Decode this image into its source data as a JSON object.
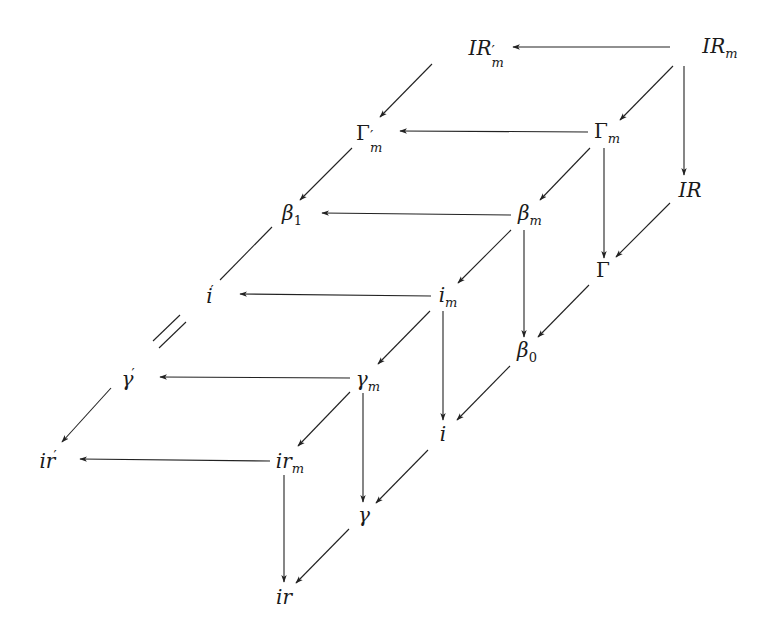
{
  "diagram": {
    "type": "commutative-diagram",
    "stroke_color": "#222222",
    "nodes": [
      {
        "id": "IRpm",
        "base": "IR",
        "prime": "′",
        "sub": "m",
        "x": 487,
        "y": 48
      },
      {
        "id": "IRm",
        "base": "IR",
        "prime": "",
        "sub": "m",
        "x": 720,
        "y": 48
      },
      {
        "id": "Gpm",
        "base": "Γ",
        "prime": "′",
        "sub": "m",
        "x": 370,
        "y": 133,
        "upright": true
      },
      {
        "id": "Gm",
        "base": "Γ",
        "prime": "",
        "sub": "m",
        "x": 607,
        "y": 133,
        "upright": true
      },
      {
        "id": "IR",
        "base": "IR",
        "prime": "",
        "sub": "",
        "x": 690,
        "y": 190
      },
      {
        "id": "b1",
        "base": "β",
        "prime": "",
        "sub": "1",
        "x": 292,
        "y": 215
      },
      {
        "id": "bm",
        "base": "β",
        "prime": "",
        "sub": "m",
        "x": 530,
        "y": 215
      },
      {
        "id": "G",
        "base": "Γ",
        "prime": "",
        "sub": "",
        "x": 603,
        "y": 270,
        "upright": true
      },
      {
        "id": "ip",
        "base": "i",
        "prime": "′",
        "sub": "",
        "x": 210,
        "y": 295
      },
      {
        "id": "im",
        "base": "i",
        "prime": "",
        "sub": "m",
        "x": 448,
        "y": 297
      },
      {
        "id": "b0",
        "base": "β",
        "prime": "",
        "sub": "0",
        "x": 527,
        "y": 352
      },
      {
        "id": "gp",
        "base": "γ",
        "prime": "′",
        "sub": "",
        "x": 128,
        "y": 378
      },
      {
        "id": "gm",
        "base": "γ",
        "prime": "",
        "sub": "m",
        "x": 368,
        "y": 381
      },
      {
        "id": "i",
        "base": "i",
        "prime": "",
        "sub": "",
        "x": 443,
        "y": 434
      },
      {
        "id": "irp",
        "base": "ir",
        "prime": "′",
        "sub": "",
        "x": 48,
        "y": 460
      },
      {
        "id": "irm",
        "base": "ir",
        "prime": "",
        "sub": "m",
        "x": 290,
        "y": 463
      },
      {
        "id": "g",
        "base": "γ",
        "prime": "",
        "sub": "",
        "x": 364,
        "y": 515
      },
      {
        "id": "ir",
        "base": "ir",
        "prime": "",
        "sub": "",
        "x": 284,
        "y": 597
      }
    ],
    "arrows": [
      {
        "x1": 670,
        "y1": 47,
        "x2": 513,
        "y2": 47
      },
      {
        "x1": 673,
        "y1": 66,
        "x2": 620,
        "y2": 120
      },
      {
        "x1": 684,
        "y1": 66,
        "x2": 684,
        "y2": 175
      },
      {
        "x1": 432,
        "y1": 64,
        "x2": 380,
        "y2": 117
      },
      {
        "x1": 588,
        "y1": 132,
        "x2": 400,
        "y2": 131
      },
      {
        "x1": 590,
        "y1": 148,
        "x2": 540,
        "y2": 200
      },
      {
        "x1": 604,
        "y1": 148,
        "x2": 604,
        "y2": 258
      },
      {
        "x1": 670,
        "y1": 203,
        "x2": 616,
        "y2": 257
      },
      {
        "x1": 352,
        "y1": 148,
        "x2": 300,
        "y2": 200
      },
      {
        "x1": 511,
        "y1": 215,
        "x2": 322,
        "y2": 213
      },
      {
        "x1": 511,
        "y1": 230,
        "x2": 458,
        "y2": 283
      },
      {
        "x1": 524,
        "y1": 230,
        "x2": 524,
        "y2": 337
      },
      {
        "x1": 589,
        "y1": 285,
        "x2": 538,
        "y2": 337
      },
      {
        "x1": 431,
        "y1": 296,
        "x2": 240,
        "y2": 294
      },
      {
        "x1": 430,
        "y1": 311,
        "x2": 378,
        "y2": 364
      },
      {
        "x1": 443,
        "y1": 311,
        "x2": 443,
        "y2": 420
      },
      {
        "x1": 510,
        "y1": 366,
        "x2": 457,
        "y2": 420
      },
      {
        "x1": 350,
        "y1": 378,
        "x2": 160,
        "y2": 377
      },
      {
        "x1": 350,
        "y1": 392,
        "x2": 298,
        "y2": 446
      },
      {
        "x1": 363,
        "y1": 393,
        "x2": 363,
        "y2": 502
      },
      {
        "x1": 428,
        "y1": 450,
        "x2": 376,
        "y2": 503
      },
      {
        "x1": 111,
        "y1": 388,
        "x2": 62,
        "y2": 442
      },
      {
        "x1": 270,
        "y1": 461,
        "x2": 80,
        "y2": 459
      },
      {
        "x1": 284,
        "y1": 475,
        "x2": 284,
        "y2": 582
      },
      {
        "x1": 349,
        "y1": 529,
        "x2": 296,
        "y2": 583
      }
    ],
    "lines": [
      {
        "x1": 272,
        "y1": 227,
        "x2": 220,
        "y2": 280
      },
      {
        "x1": 180,
        "y1": 315,
        "x2": 153,
        "y2": 341
      },
      {
        "x1": 186,
        "y1": 322,
        "x2": 159,
        "y2": 348
      }
    ]
  }
}
